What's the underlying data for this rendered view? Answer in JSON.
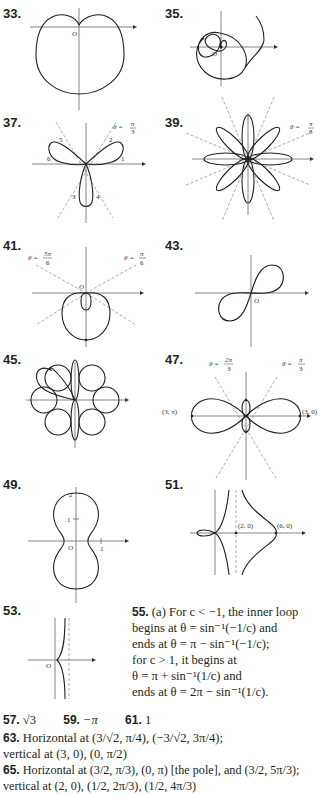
{
  "problems": [
    {
      "id": "33",
      "label": "33.",
      "figure": "cardioid-like curve, dimpled top at pole",
      "annotations": [
        "O"
      ]
    },
    {
      "id": "35",
      "label": "35.",
      "figure": "spiral from pole",
      "annotations": [
        "O"
      ]
    },
    {
      "id": "37",
      "label": "37.",
      "figure": "three-leaved rose with numbered arcs",
      "annotations": [
        "θ = π/3",
        "1",
        "2",
        "3",
        "4",
        "5",
        "6"
      ]
    },
    {
      "id": "39",
      "label": "39.",
      "figure": "eight-leaved rose",
      "annotations": [
        "θ = π/8"
      ]
    },
    {
      "id": "41",
      "label": "41.",
      "figure": "limaçon with inner loop",
      "annotations": [
        "θ = 5π/6",
        "θ = π/6",
        "O"
      ]
    },
    {
      "id": "43",
      "label": "43.",
      "figure": "lemniscate",
      "annotations": [
        "O"
      ]
    },
    {
      "id": "45",
      "label": "45.",
      "figure": "six-petal overlapping curve",
      "annotations": []
    },
    {
      "id": "47",
      "label": "47.",
      "figure": "two large loops and two small loops",
      "annotations": [
        "θ = 2π/3",
        "θ = π/3",
        "(3, π)",
        "(3, 0)"
      ]
    },
    {
      "id": "49",
      "label": "49.",
      "figure": "peanut-shaped curve",
      "annotations": [
        "2",
        "1",
        "O",
        "1"
      ]
    },
    {
      "id": "51",
      "label": "51.",
      "figure": "conchoid with asymptote",
      "annotations": [
        "(2, 0)",
        "(6, 0)"
      ]
    },
    {
      "id": "53",
      "label": "53.",
      "figure": "curve with vertical asymptote",
      "annotations": [
        "O"
      ]
    }
  ],
  "fig_labels": {
    "O": "O",
    "p37_theta": "θ =",
    "p37_num": "π",
    "p37_den": "3",
    "p37_n1": "1",
    "p37_n2": "2",
    "p37_n3": "3",
    "p37_n4": "4",
    "p37_n5": "5",
    "p37_n6": "6",
    "p39_theta": "θ =",
    "p39_num": "π",
    "p39_den": "8",
    "p41_theta_l": "θ =",
    "p41_num_l": "5π",
    "p41_den_l": "6",
    "p41_theta_r": "θ =",
    "p41_num_r": "π",
    "p41_den_r": "6",
    "p47_theta_l": "θ =",
    "p47_num_l": "2π",
    "p47_den_l": "3",
    "p47_theta_r": "θ =",
    "p47_num_r": "π",
    "p47_den_r": "3",
    "p47_pt_l": "(3, π)",
    "p47_pt_r": "(3, 0)",
    "p49_t2": "2",
    "p49_t1": "1",
    "p49_x1": "1",
    "p51_pt1": "(2, 0)",
    "p51_pt2": "(6, 0)"
  },
  "answer_55": {
    "label": "55.",
    "lines": [
      "(a) For c < −1, the inner loop",
      "begins at θ = sin⁻¹(−1/c) and",
      "ends at θ = π − sin⁻¹(−1/c);",
      "for c > 1, it begins at",
      "θ = π + sin⁻¹(1/c) and",
      "ends at θ = 2π − sin⁻¹(1/c)."
    ]
  },
  "answers_short": [
    {
      "label": "57.",
      "value": "√3"
    },
    {
      "label": "59.",
      "value": "−π"
    },
    {
      "label": "61.",
      "value": "1"
    }
  ],
  "answer_63": {
    "label": "63.",
    "line1": "Horizontal at (3/√2, π/4), (−3/√2, 3π/4);",
    "line2": "vertical at (3, 0), (0, π/2)"
  },
  "answer_65": {
    "label": "65.",
    "line1": "Horizontal at (3/2, π/3), (0, π) [the pole], and (3/2, 5π/3);",
    "line2": "vertical at (2, 0), (1/2, 2π/3), (1/2, 4π/3)"
  }
}
